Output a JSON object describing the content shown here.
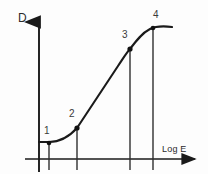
{
  "figure": {
    "background_color": "#fdfdfd",
    "ink_color": "#1a1a1a",
    "text_color": "#2b2b2b",
    "width": 208,
    "height": 174
  },
  "axes": {
    "y_label": "D",
    "x_label": "Log E",
    "y_axis_x": 39,
    "x_axis_y": 159,
    "y_axis_top": 17,
    "y_axis_bottom": 172,
    "x_axis_left": 25,
    "x_axis_right": 200,
    "arrows": "both"
  },
  "points": [
    {
      "label": "1",
      "x": 49,
      "y": 143,
      "label_x": 44,
      "label_y": 125,
      "drop_bottom": 170
    },
    {
      "label": "2",
      "x": 77,
      "y": 128,
      "label_x": 69,
      "label_y": 108,
      "drop_bottom": 170
    },
    {
      "label": "3",
      "x": 130,
      "y": 49,
      "label_x": 122,
      "label_y": 29,
      "drop_bottom": 170
    },
    {
      "label": "4",
      "x": 153,
      "y": 28,
      "label_x": 153,
      "label_y": 9,
      "drop_bottom": 170
    }
  ],
  "curve": {
    "path": "M 39 142 L 49 142 C 58 142 68 138 77 128 L 118 66 C 124 57 127 52 130 49 C 136 41 142 33 150 29 C 156 26 164 26 172 27",
    "stroke_width": 2.1
  },
  "chart_data": {
    "type": "line",
    "title": "",
    "xlabel": "Log E",
    "ylabel": "D",
    "legend": [],
    "grid": false,
    "annotations": [
      "1",
      "2",
      "3",
      "4"
    ],
    "series": [
      {
        "name": "characteristic-curve",
        "x": [
          0.0,
          0.1,
          0.24,
          0.49,
          0.7,
          0.87,
          1.0
        ],
        "y": [
          0.12,
          0.12,
          0.23,
          0.77,
          0.94,
          1.0,
          1.01
        ]
      }
    ],
    "marked_points": [
      {
        "label": "1",
        "x": 0.1,
        "y": 0.12
      },
      {
        "label": "2",
        "x": 0.24,
        "y": 0.23
      },
      {
        "label": "3",
        "x": 0.74,
        "y": 0.79
      },
      {
        "label": "4",
        "x": 0.88,
        "y": 0.95
      }
    ],
    "xlim": [
      0,
      1
    ],
    "ylim": [
      0,
      1.1
    ]
  }
}
